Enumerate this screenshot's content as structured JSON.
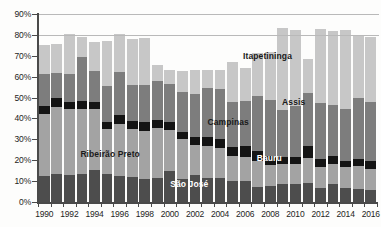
{
  "chart_data": {
    "type": "bar",
    "subtype": "stacked-bar",
    "title": "",
    "subtitle": "",
    "xlabel": "",
    "ylabel": "",
    "grid": true,
    "legend_position": "inline-annotations",
    "ylim": [
      0,
      90
    ],
    "ytick_labels": [
      "0%",
      "10%",
      "20%",
      "30%",
      "40%",
      "50%",
      "60%",
      "70%",
      "80%",
      "90%"
    ],
    "ytick_values": [
      0,
      10,
      20,
      30,
      40,
      50,
      60,
      70,
      80,
      90
    ],
    "categories": [
      "1990",
      "1991",
      "1992",
      "1993",
      "1994",
      "1995",
      "1996",
      "1997",
      "1998",
      "1999",
      "2000",
      "2001",
      "2002",
      "2003",
      "2004",
      "2005",
      "2006",
      "2007",
      "2008",
      "2009",
      "2010",
      "2011",
      "2012",
      "2013",
      "2014",
      "2015",
      "2016"
    ],
    "xtick_labels_shown": [
      "1990",
      "1992",
      "1994",
      "1996",
      "1998",
      "2000",
      "2002",
      "2004",
      "2006",
      "2008",
      "2010",
      "2012",
      "2014",
      "2016"
    ],
    "series": [
      {
        "name": "São José",
        "color": "#4d4d4d",
        "values": [
          12.5,
          13.3,
          13.0,
          13.2,
          15.2,
          13.2,
          12.6,
          12.2,
          10.8,
          11.5,
          14.8,
          11.2,
          12.7,
          11.5,
          11.7,
          10.0,
          10.0,
          7.4,
          7.6,
          8.8,
          8.7,
          9.1,
          6.7,
          8.4,
          6.7,
          6.1,
          5.8
        ]
      },
      {
        "name": "Ribeirão Preto",
        "color": "#a3a3a3",
        "values": [
          29.6,
          32.2,
          31.4,
          31.4,
          29.2,
          21.6,
          24.8,
          22.7,
          23.4,
          24.0,
          19.6,
          18.8,
          14.4,
          15.3,
          14.2,
          11.8,
          11.7,
          12.4,
          10.2,
          9.3,
          9.6,
          11.8,
          10.1,
          9.6,
          10.0,
          11.0,
          10.1
        ]
      },
      {
        "name": "Bauru",
        "color": "#141414",
        "values": [
          4.0,
          4.5,
          3.6,
          3.7,
          3.5,
          3.6,
          4.3,
          4.0,
          4.2,
          3.7,
          3.8,
          3.4,
          3.9,
          4.3,
          4.5,
          4.4,
          5.3,
          4.6,
          4.2,
          3.5,
          3.4,
          5.9,
          3.6,
          4.0,
          3.0,
          3.5,
          3.6
        ]
      },
      {
        "name": "Campinas",
        "color": "#7d7d7d",
        "values": [
          15.4,
          12.0,
          13.4,
          21.0,
          14.7,
          17.0,
          20.4,
          17.0,
          17.6,
          18.6,
          18.2,
          19.4,
          20.9,
          23.4,
          23.7,
          21.9,
          21.3,
          26.3,
          26.7,
          22.4,
          24.3,
          25.5,
          27.0,
          24.3,
          24.6,
          29.3,
          28.3
        ]
      },
      {
        "name": "Itapetininga",
        "color": "#c7c7c7",
        "values": [
          13.8,
          13.6,
          18.8,
          9.6,
          13.8,
          21.8,
          18.3,
          22.0,
          22.4,
          8.0,
          7.0,
          10.1,
          11.2,
          8.7,
          9.2,
          18.9,
          16.0,
          20.7,
          23.0,
          39.5,
          36.5,
          16.2,
          35.5,
          35.4,
          37.9,
          29.9,
          31.2
        ]
      }
    ],
    "totals": [
      75.3,
      75.6,
      80.2,
      78.9,
      76.4,
      77.2,
      80.4,
      77.9,
      78.4,
      65.8,
      63.4,
      62.9,
      63.1,
      63.2,
      63.3,
      67.0,
      64.3,
      71.4,
      71.7,
      83.5,
      82.5,
      68.5,
      82.9,
      81.7,
      82.2,
      79.8,
      79.0
    ],
    "annotations": [
      {
        "text": "Itapetininga",
        "style": "dark",
        "x_pct": 60.5,
        "y_pct": 70.0
      },
      {
        "text": "Assis",
        "style": "dark",
        "x_pct": 72.0,
        "y_pct": 48.0
      },
      {
        "text": "Campinas",
        "style": "dark",
        "x_pct": 50.0,
        "y_pct": 38.5
      },
      {
        "text": "Ribeirão Preto",
        "style": "dark",
        "x_pct": 12.5,
        "y_pct": 23.0
      },
      {
        "text": "Bauru",
        "style": "light",
        "x_pct": 64.5,
        "y_pct": 21.0
      },
      {
        "text": "São José",
        "style": "light",
        "x_pct": 39.0,
        "y_pct": 8.5
      }
    ],
    "colors": {
      "axis": "#4a4a4a",
      "gridline": "#b9b9b9",
      "background": "#fdfdfc",
      "text": "#1d1d1d"
    }
  }
}
